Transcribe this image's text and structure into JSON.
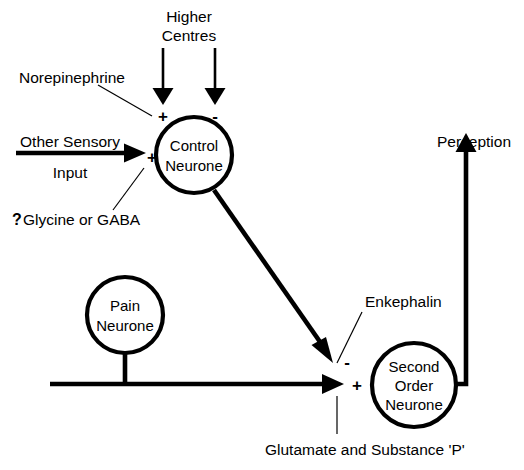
{
  "diagram": {
    "background_color": "#ffffff",
    "ink_color": "#000000",
    "width": 524,
    "height": 470
  },
  "labels": {
    "higher_centres_line1": "Higher",
    "higher_centres_line2": "Centres",
    "norepinephrine": "Norepinephrine",
    "other_sensory_line1": "Other Sensory",
    "other_sensory_line2": "Input",
    "glycine_gaba_marker": "?",
    "glycine_gaba": "Glycine or GABA",
    "perception": "Perception",
    "enkephalin": "Enkephalin",
    "glutamate_substance_p": "Glutamate and Substance 'P'"
  },
  "nodes": {
    "control_neurone": {
      "line1": "Control",
      "line2": "Neurone"
    },
    "pain_neurone": {
      "line1": "Pain",
      "line2": "Neurone"
    },
    "second_order_neurone": {
      "line1": "Second",
      "line2": "Order",
      "line3": "Neurone"
    }
  },
  "signs": {
    "higher_centres_excitatory": "+",
    "higher_centres_inhibitory": "-",
    "other_sensory_excitatory": "+",
    "control_to_synapse_inhibitory": "-",
    "pain_to_second_order_excitatory": "+"
  }
}
